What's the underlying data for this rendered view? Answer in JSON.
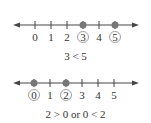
{
  "diagrams": [
    {
      "ticks": [
        "0",
        "1",
        "2",
        "3",
        "4",
        "5"
      ],
      "circled": [
        "3",
        "5"
      ],
      "caption": "3 < 5"
    },
    {
      "ticks": [
        "0",
        "1",
        "2",
        "3",
        "4",
        "5"
      ],
      "circled": [
        "0",
        "2"
      ],
      "caption": "2 > 0  or  0 < 2"
    }
  ],
  "colors": {
    "line": "#444444",
    "point": "#666666",
    "text": "#333333"
  }
}
